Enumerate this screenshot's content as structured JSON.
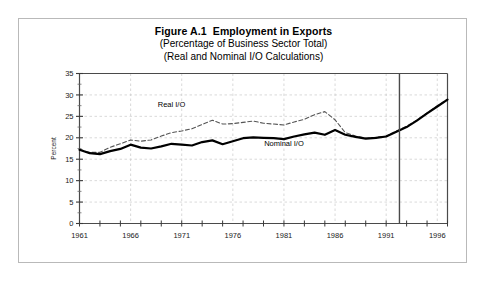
{
  "figure": {
    "title_line1": "Figure A.1  Employment in Exports",
    "title_line2": "(Percentage of Business Sector Total)",
    "title_line3": "(Real and Nominal I/O Calculations)",
    "border_color": "#b9b9b9",
    "background": "#ffffff"
  },
  "chart_data": {
    "type": "line",
    "title": "Figure A.1  Employment in Exports",
    "subtitle": "(Percentage of Business Sector Total) (Real and Nominal I/O Calculations)",
    "xlabel": "",
    "ylabel": "Percent",
    "xlim": [
      1961,
      1997
    ],
    "ylim": [
      0,
      35
    ],
    "yticks": [
      0,
      5,
      10,
      15,
      20,
      25,
      30,
      35
    ],
    "xticks": [
      1961,
      1966,
      1971,
      1976,
      1981,
      1986,
      1991,
      1996
    ],
    "xtick_labels": [
      "1961",
      "1966",
      "1971",
      "1976",
      "1981",
      "1986",
      "1991",
      "1996"
    ],
    "minor_xtick_interval": 2,
    "grid": true,
    "grid_style": "dashed",
    "grid_color": "#c8c8c8",
    "legend": "inline-annotation",
    "x": [
      1961,
      1962,
      1963,
      1964,
      1965,
      1966,
      1967,
      1968,
      1969,
      1970,
      1971,
      1972,
      1973,
      1974,
      1975,
      1976,
      1977,
      1978,
      1979,
      1980,
      1981,
      1982,
      1983,
      1984,
      1985,
      1986,
      1987,
      1988,
      1989,
      1990,
      1991,
      1992,
      1993,
      1994,
      1995,
      1996,
      1997
    ],
    "series": [
      {
        "name": "Nominal I/O",
        "style": "solid",
        "color": "#000000",
        "width": 2.2,
        "label_x": 1981,
        "label_y": 18.1,
        "values": [
          17.2,
          16.4,
          16.2,
          16.9,
          17.4,
          18.4,
          17.7,
          17.5,
          18.0,
          18.6,
          18.4,
          18.2,
          19.0,
          19.4,
          18.5,
          19.2,
          19.9,
          20.1,
          20.0,
          19.9,
          19.7,
          20.3,
          20.8,
          21.2,
          20.7,
          21.8,
          20.7,
          20.2,
          19.8,
          20.0,
          20.3,
          21.4,
          22.5,
          24.0,
          25.7,
          27.3,
          28.9
        ]
      },
      {
        "name": "Real I/O",
        "style": "dashed",
        "color": "#555555",
        "width": 1.1,
        "label_x": 1970,
        "label_y": 27.2,
        "values": [
          17.3,
          16.6,
          16.6,
          17.8,
          18.6,
          19.5,
          19.2,
          19.5,
          20.4,
          21.2,
          21.6,
          22.1,
          23.1,
          24.1,
          23.2,
          23.3,
          23.6,
          23.9,
          23.4,
          23.2,
          23.0,
          23.7,
          24.3,
          25.4,
          26.1,
          24.2,
          21.2,
          20.4,
          19.9,
          20.1,
          20.4,
          21.6,
          22.7,
          24.1,
          25.8,
          27.4,
          29.0
        ]
      }
    ],
    "vline": {
      "x": 1992.3,
      "color": "#4a4a4a",
      "width": 1.4,
      "note": "solid vertical divider"
    },
    "annotations": [
      {
        "text": "Real I/O",
        "x": 1970,
        "y": 27.2
      },
      {
        "text": "Nominal I/O",
        "x": 1981,
        "y": 18.1
      }
    ]
  }
}
